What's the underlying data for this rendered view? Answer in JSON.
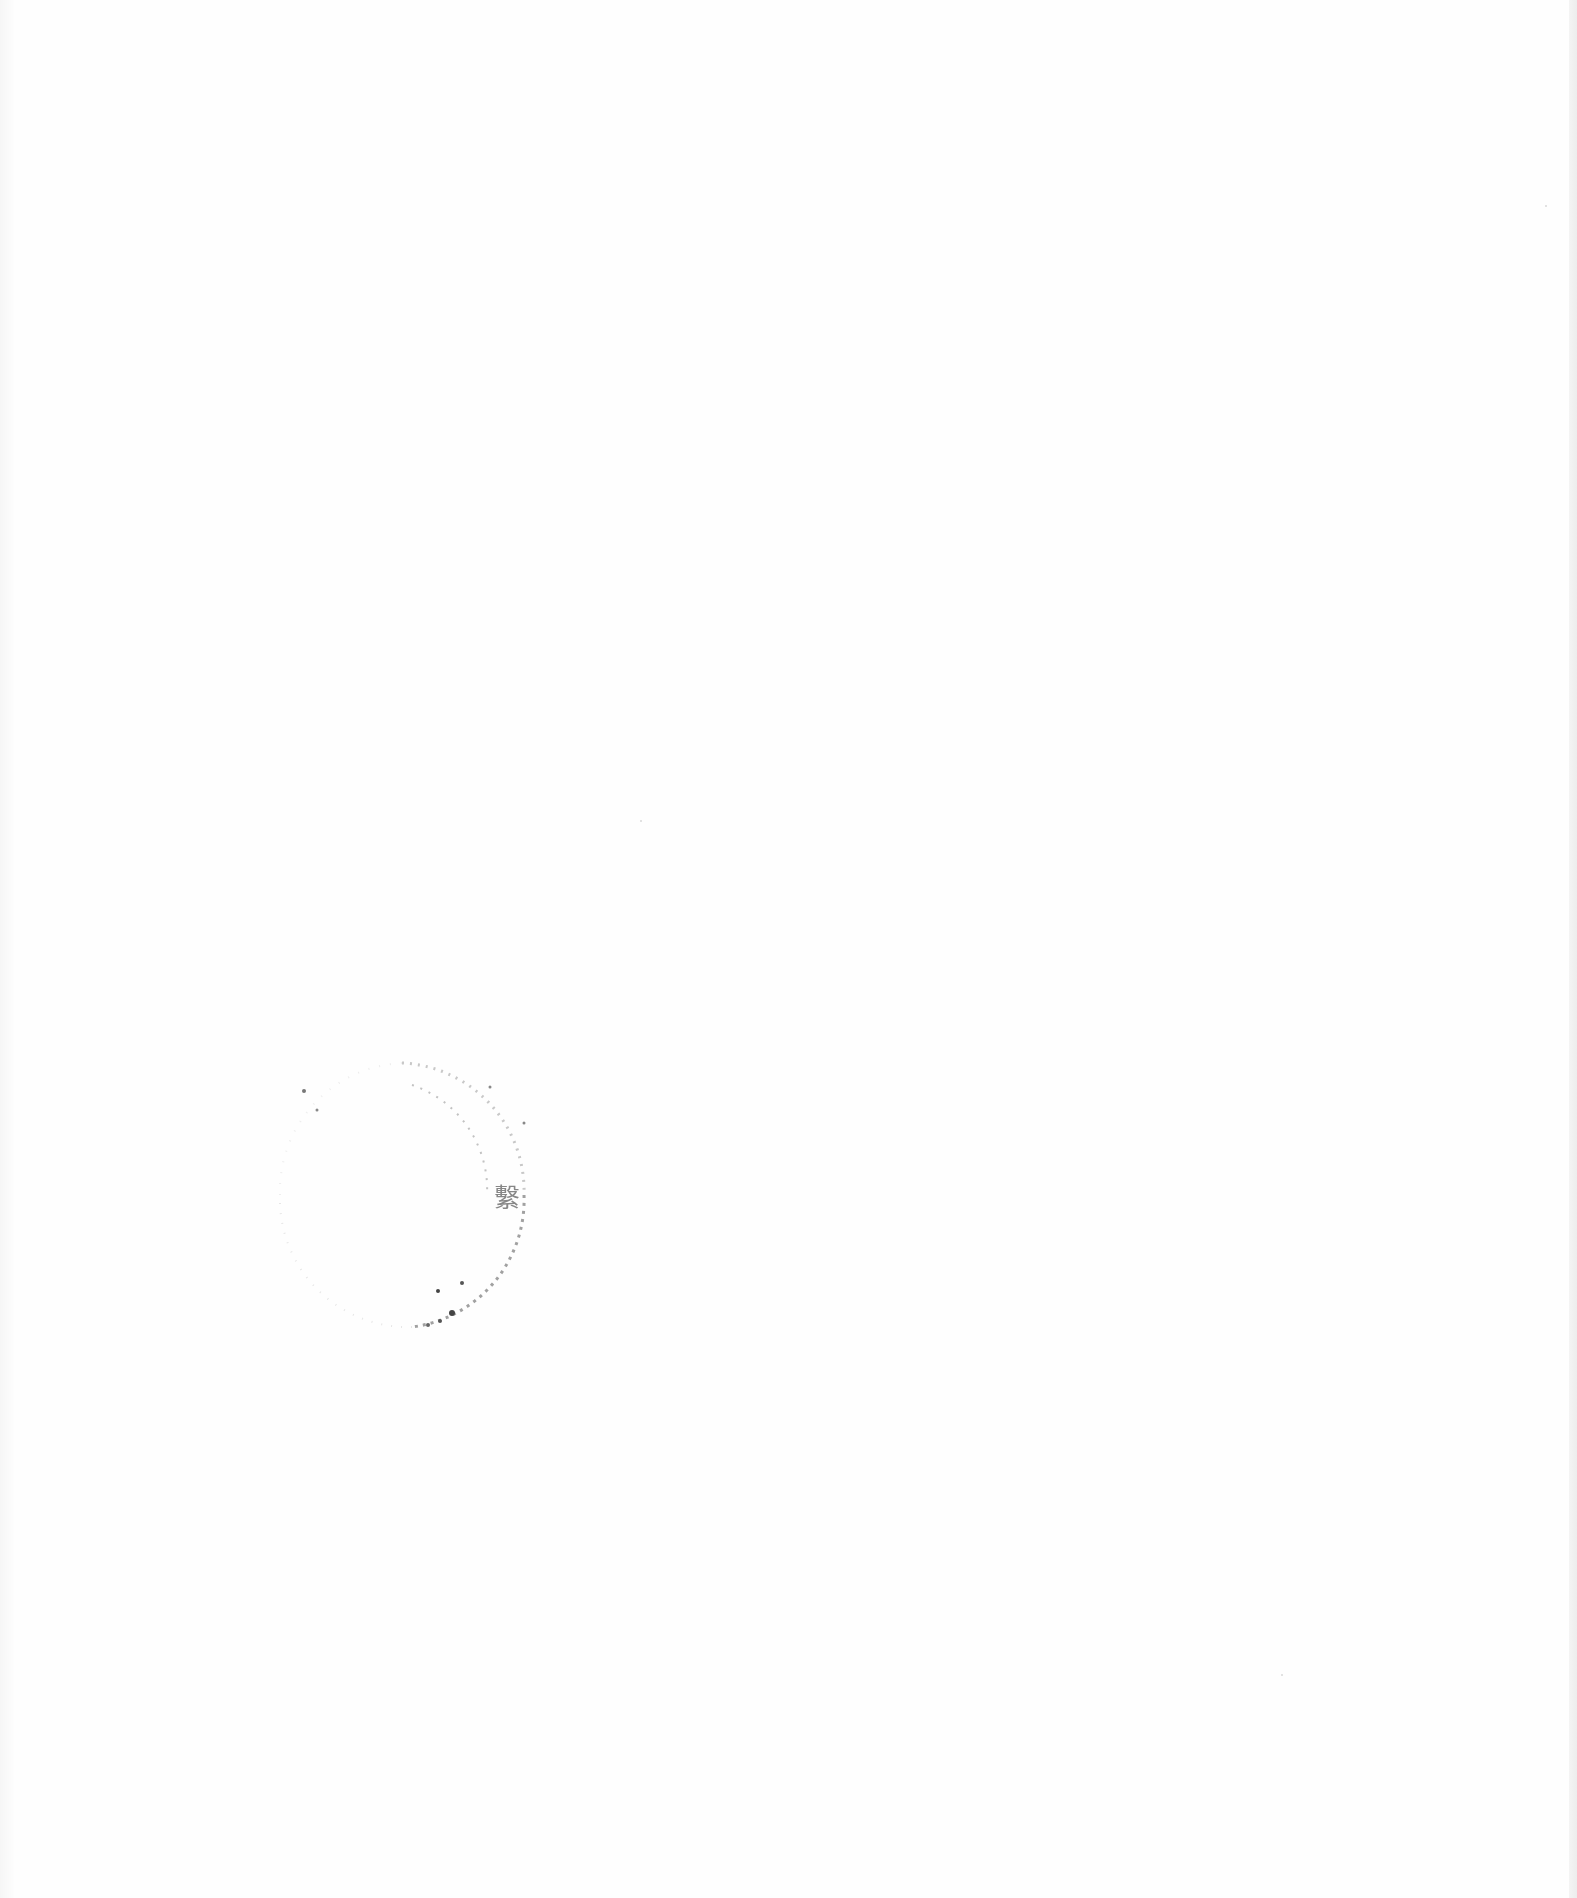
{
  "document": {
    "type": "scanned-page",
    "content": "blank",
    "background_color": "#fefefe"
  },
  "seal": {
    "shape": "circle",
    "color": "#555555",
    "visible_character": "繫",
    "legible": false
  }
}
